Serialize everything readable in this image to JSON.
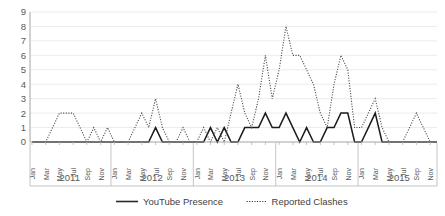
{
  "chart_data": {
    "type": "line",
    "title": "",
    "xlabel": "",
    "ylabel": "",
    "ylim": [
      0,
      9
    ],
    "yticks": [
      0,
      1,
      2,
      3,
      4,
      5,
      6,
      7,
      8,
      9
    ],
    "grid": true,
    "legend_position": "bottom",
    "years": [
      "2011",
      "2012",
      "2013",
      "2014",
      "2015"
    ],
    "month_ticks": [
      "Jan",
      "Mar",
      "May",
      "Jul",
      "Sep",
      "Nov"
    ],
    "months_all": [
      "Jan",
      "Feb",
      "Mar",
      "Apr",
      "May",
      "Jun",
      "Jul",
      "Aug",
      "Sep",
      "Oct",
      "Nov",
      "Dec"
    ],
    "x": [
      "Jan 2011",
      "Feb 2011",
      "Mar 2011",
      "Apr 2011",
      "May 2011",
      "Jun 2011",
      "Jul 2011",
      "Aug 2011",
      "Sep 2011",
      "Oct 2011",
      "Nov 2011",
      "Dec 2011",
      "Jan 2012",
      "Feb 2012",
      "Mar 2012",
      "Apr 2012",
      "May 2012",
      "Jun 2012",
      "Jul 2012",
      "Aug 2012",
      "Sep 2012",
      "Oct 2012",
      "Nov 2012",
      "Dec 2012",
      "Jan 2013",
      "Feb 2013",
      "Mar 2013",
      "Apr 2013",
      "May 2013",
      "Jun 2013",
      "Jul 2013",
      "Aug 2013",
      "Sep 2013",
      "Oct 2013",
      "Nov 2013",
      "Dec 2013",
      "Jan 2014",
      "Feb 2014",
      "Mar 2014",
      "Apr 2014",
      "May 2014",
      "Jun 2014",
      "Jul 2014",
      "Aug 2014",
      "Sep 2014",
      "Oct 2014",
      "Nov 2014",
      "Dec 2014",
      "Jan 2015",
      "Feb 2015",
      "Mar 2015",
      "Apr 2015",
      "May 2015",
      "Jun 2015",
      "Jul 2015",
      "Aug 2015",
      "Sep 2015",
      "Oct 2015",
      "Nov 2015",
      "Dec 2015"
    ],
    "series": [
      {
        "name": "YouTube Presence",
        "style": "solid",
        "color": "#1c1c1c",
        "values": [
          0,
          0,
          0,
          0,
          0,
          0,
          0,
          0,
          0,
          0,
          0,
          0,
          0,
          0,
          0,
          0,
          0,
          0,
          1,
          0,
          0,
          0,
          0,
          0,
          0,
          0,
          1,
          0,
          1,
          0,
          0,
          1,
          1,
          1,
          2,
          1,
          1,
          2,
          1,
          0,
          1,
          0,
          0,
          1,
          1,
          2,
          2,
          0,
          0,
          1,
          2,
          0,
          0,
          0,
          0,
          0,
          0,
          0,
          0,
          0
        ]
      },
      {
        "name": "Reported Clashes",
        "style": "dotted",
        "color": "#4a4a4a",
        "values": [
          0,
          0,
          0,
          1,
          2,
          2,
          2,
          1,
          0,
          1,
          0,
          1,
          0,
          0,
          0,
          1,
          2,
          1,
          3,
          1,
          0,
          0,
          1,
          0,
          0,
          1,
          0,
          1,
          0,
          2,
          4,
          2,
          1,
          3,
          6,
          3,
          5,
          8,
          6,
          6,
          5,
          4,
          2,
          1,
          4,
          6,
          5,
          1,
          1,
          2,
          3,
          1,
          0,
          0,
          0,
          1,
          2,
          1,
          0,
          0
        ]
      }
    ]
  },
  "axis": {
    "y_label_values": [
      "9",
      "8",
      "7",
      "6",
      "5",
      "4",
      "3",
      "2",
      "1",
      "0"
    ]
  },
  "legend": {
    "items": [
      {
        "label": "YouTube Presence",
        "style": "solid"
      },
      {
        "label": "Reported Clashes",
        "style": "dotted"
      }
    ]
  }
}
